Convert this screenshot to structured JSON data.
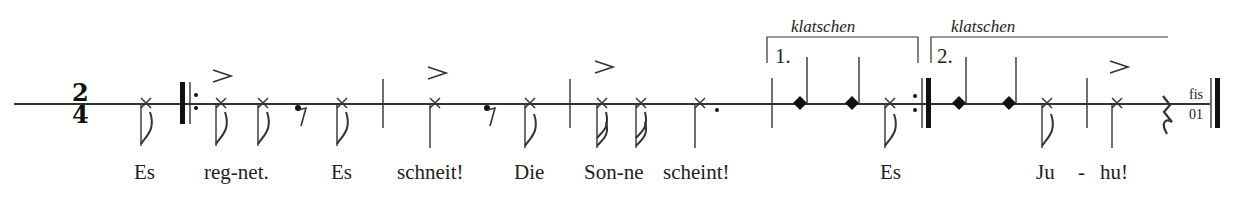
{
  "time_signature": {
    "numerator": "2",
    "denominator": "4"
  },
  "lyrics": [
    "Es",
    "reg-net.",
    "Es",
    "schneit!",
    "Die",
    "Son-ne",
    "scheint!",
    "Es",
    "Ju",
    "-",
    "hu!"
  ],
  "voltas": [
    {
      "number": "1.",
      "instruction": "klatschen"
    },
    {
      "number": "2.",
      "instruction": "klatschen"
    }
  ],
  "end_label": {
    "top": "fis",
    "bottom": "01"
  },
  "symbols": {
    "notehead_spoken": "x-notehead",
    "notehead_clap": "diamond-notehead",
    "accent": ">",
    "repeat_start": "repeat-start-barline",
    "repeat_end": "repeat-end-barline",
    "final_barline": "final-barline"
  }
}
